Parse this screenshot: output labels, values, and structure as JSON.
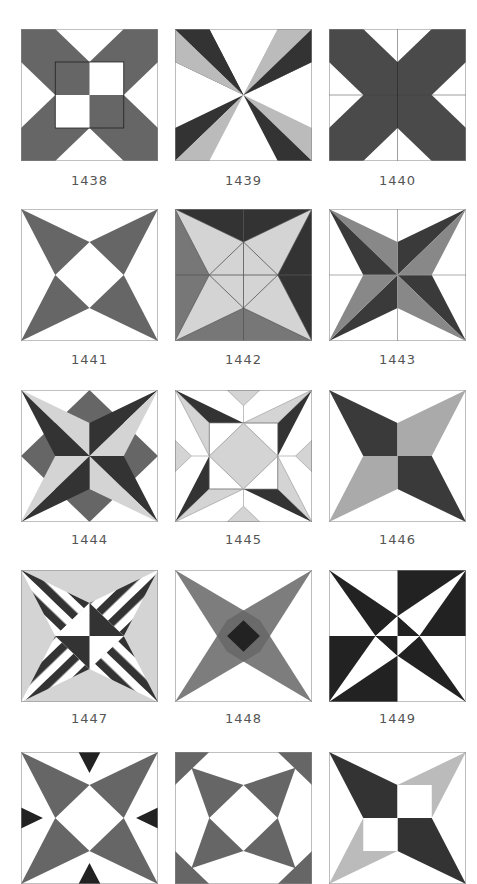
{
  "colors": {
    "dark": "#333333",
    "medium": "#666666",
    "light": "#bbbbbb",
    "pale": "#d4d4d4",
    "white": "#ffffff",
    "line": "#888888",
    "label": "#555555"
  },
  "blocks": [
    {
      "id": "1438",
      "label": "1438",
      "row": 0,
      "col": 0
    },
    {
      "id": "1439",
      "label": "1439",
      "row": 0,
      "col": 1
    },
    {
      "id": "1440",
      "label": "1440",
      "row": 0,
      "col": 2
    },
    {
      "id": "1441",
      "label": "1441",
      "row": 1,
      "col": 0
    },
    {
      "id": "1442",
      "label": "1442",
      "row": 1,
      "col": 1
    },
    {
      "id": "1443",
      "label": "1443",
      "row": 1,
      "col": 2
    },
    {
      "id": "1444",
      "label": "1444",
      "row": 2,
      "col": 0
    },
    {
      "id": "1445",
      "label": "1445",
      "row": 2,
      "col": 1
    },
    {
      "id": "1446",
      "label": "1446",
      "row": 2,
      "col": 2
    },
    {
      "id": "1447",
      "label": "1447",
      "row": 3,
      "col": 0
    },
    {
      "id": "1448",
      "label": "1448",
      "row": 3,
      "col": 1
    },
    {
      "id": "1449",
      "label": "1449",
      "row": 3,
      "col": 2
    },
    {
      "id": "1450",
      "label": "",
      "row": 4,
      "col": 0
    },
    {
      "id": "1451",
      "label": "",
      "row": 4,
      "col": 1
    },
    {
      "id": "1452",
      "label": "",
      "row": 4,
      "col": 2
    }
  ]
}
